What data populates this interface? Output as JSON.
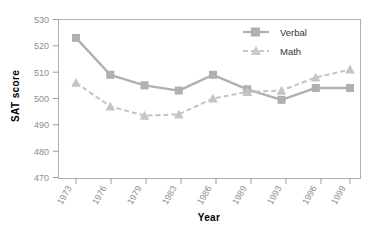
{
  "chart_data": {
    "type": "line",
    "title": "",
    "xlabel": "Year",
    "ylabel": "SAT score",
    "categories": [
      "1973",
      "1976",
      "1979",
      "1983",
      "1986",
      "1989",
      "1993",
      "1996",
      "1999"
    ],
    "ylim": [
      470,
      530
    ],
    "yticks": [
      470,
      480,
      490,
      500,
      510,
      520,
      530
    ],
    "grid": false,
    "legend_position": "top-right",
    "series": [
      {
        "name": "Verbal",
        "values": [
          523,
          509,
          505,
          503,
          509,
          503.5,
          499.5,
          504,
          504
        ],
        "marker": "square",
        "linestyle": "solid",
        "color": "#b0b0b0"
      },
      {
        "name": "Math",
        "values": [
          506,
          497,
          493.5,
          494,
          500,
          502.5,
          503,
          508,
          511
        ],
        "marker": "triangle",
        "linestyle": "dashed",
        "color": "#c4c4c4"
      }
    ]
  },
  "axes": {
    "y_label": "SAT score",
    "x_label": "Year",
    "y_tick_labels": [
      "530",
      "520",
      "510",
      "500",
      "490",
      "480",
      "470"
    ],
    "x_tick_labels": [
      "1973",
      "1976",
      "1979",
      "1983",
      "1986",
      "1989",
      "1993",
      "1996",
      "1999"
    ]
  },
  "legend": {
    "entries": [
      {
        "label": "Verbal"
      },
      {
        "label": "Math"
      }
    ]
  },
  "colors": {
    "verbal": "#b0b0b0",
    "math": "#c8c8c8",
    "frame": "#b0b0b0",
    "tick_text": "#8d8d8d",
    "axis_title": "#000000"
  }
}
